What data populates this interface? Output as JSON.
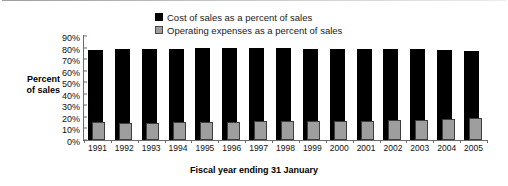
{
  "chart_data": {
    "type": "bar",
    "title": "",
    "subtitle": "",
    "xlabel": "Fiscal year ending 31 January",
    "ylabel": "Percent of sales",
    "ylabel_line1": "Percent",
    "ylabel_line2": "of sales",
    "categories": [
      "1991",
      "1992",
      "1993",
      "1994",
      "1995",
      "1996",
      "1997",
      "1998",
      "1999",
      "2000",
      "2001",
      "2002",
      "2003",
      "2004",
      "2005"
    ],
    "series": [
      {
        "name": "Cost of sales as a percent of sales",
        "color": "#000000",
        "values": [
          78.0,
          78.8,
          79.0,
          79.1,
          79.2,
          79.5,
          79.9,
          79.3,
          79.1,
          78.9,
          78.8,
          79.0,
          78.8,
          78.0,
          77.4
        ]
      },
      {
        "name": "Operating expenses as a percent of sales",
        "color": "#9e9e9e",
        "values": [
          15.6,
          14.9,
          14.6,
          15.2,
          15.7,
          16.0,
          16.2,
          16.6,
          16.7,
          16.8,
          16.8,
          17.2,
          17.3,
          18.2,
          19.0
        ]
      }
    ],
    "ylim": [
      0,
      90
    ],
    "ytick_step": 10,
    "yticks": [
      "0%",
      "10%",
      "20%",
      "30%",
      "40%",
      "50%",
      "60%",
      "70%",
      "80%",
      "90%"
    ],
    "ytick_values": [
      0,
      10,
      20,
      30,
      40,
      50,
      60,
      70,
      80,
      90
    ],
    "ytick_suffix": "%",
    "grid": false,
    "legend_position": "top-center",
    "legend": [
      "Cost of sales as a percent of sales",
      "Operating expenses as a percent of sales"
    ]
  }
}
